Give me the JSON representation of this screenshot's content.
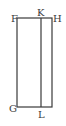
{
  "diagram": {
    "type": "geometric-figure",
    "stroke_color": "#3a3a3a",
    "points": {
      "F": {
        "label": "F",
        "x": 17,
        "y": 18
      },
      "K": {
        "label": "K",
        "x": 41,
        "y": 18
      },
      "H": {
        "label": "H",
        "x": 52,
        "y": 18
      },
      "G": {
        "label": "G",
        "x": 17,
        "y": 107
      },
      "L": {
        "label": "L",
        "x": 41,
        "y": 107
      }
    },
    "segments": [
      [
        "F",
        "H"
      ],
      [
        "H",
        "H_bottom"
      ],
      [
        "G",
        "H_bottom"
      ],
      [
        "F",
        "G"
      ],
      [
        "K",
        "L"
      ]
    ]
  }
}
